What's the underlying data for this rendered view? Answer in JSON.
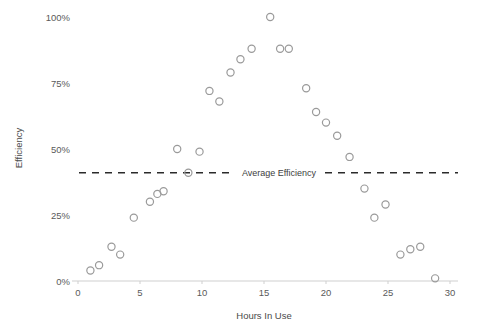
{
  "chart_data": {
    "type": "scatter",
    "title": "",
    "xlabel": "Hours In Use",
    "ylabel": "Efficiency",
    "xlim": [
      0,
      30
    ],
    "ylim": [
      0,
      100
    ],
    "grid": false,
    "legend": "none",
    "x_ticks": [
      "0",
      "5",
      "10",
      "15",
      "20",
      "25",
      "30"
    ],
    "x_tick_values": [
      0,
      5,
      10,
      15,
      20,
      25,
      30
    ],
    "y_ticks": [
      "0%",
      "25%",
      "50%",
      "75%",
      "100%"
    ],
    "y_tick_values": [
      0,
      25,
      50,
      75,
      100
    ],
    "series": [
      {
        "name": "Efficiency",
        "marker": "open-circle",
        "color": "#9a9a9a",
        "x": [
          1,
          1.7,
          2.7,
          3.4,
          4.5,
          5.8,
          6.4,
          6.9,
          8,
          8.9,
          9.8,
          10.6,
          11.4,
          12.3,
          13.1,
          14,
          15.5,
          16.3,
          17,
          18.4,
          19.2,
          20,
          20.9,
          21.9,
          23.1,
          23.9,
          24.8,
          26,
          26.8,
          27.6,
          28.8
        ],
        "y": [
          4,
          6,
          13,
          10,
          24,
          30,
          33,
          34,
          50,
          41,
          49,
          72,
          68,
          79,
          84,
          88,
          100,
          88,
          88,
          73,
          64,
          60,
          55,
          47,
          35,
          24,
          29,
          10,
          12,
          13,
          1
        ]
      }
    ],
    "annotations": [
      {
        "type": "horizontal-line",
        "label": "Average Efficiency",
        "value": 41,
        "style": "dashed",
        "color": "#2b2b2b"
      }
    ]
  }
}
